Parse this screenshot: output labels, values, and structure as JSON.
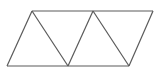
{
  "figure": {
    "name": "parallelogram-divided-into-four-triangles",
    "canvas": {
      "width": 160,
      "height": 74,
      "background": "#ffffff"
    },
    "style": {
      "stroke_color": "#5a5a5a",
      "stroke_width": 1.2,
      "fill": "none"
    },
    "vertices": {
      "bottom_left": {
        "label": "A",
        "x": 7,
        "y": 66
      },
      "top_left": {
        "label": "B",
        "x": 32,
        "y": 11
      },
      "bottom_mid": {
        "label": "C",
        "x": 68,
        "y": 66
      },
      "top_mid": {
        "label": "D",
        "x": 93,
        "y": 11
      },
      "bottom_right": {
        "label": "E",
        "x": 129,
        "y": 66
      },
      "top_right": {
        "label": "F",
        "x": 153,
        "y": 11
      }
    },
    "edges": [
      {
        "name": "top-edge",
        "from": "top_left",
        "to": "top_right",
        "points": "32,11 153,11"
      },
      {
        "name": "bottom-edge",
        "from": "bottom_left",
        "to": "bottom_right",
        "points": "7,66 129,66"
      },
      {
        "name": "left-slant-edge",
        "from": "bottom_left",
        "to": "top_left",
        "points": "7,66 32,11"
      },
      {
        "name": "right-slant-edge",
        "from": "bottom_right",
        "to": "top_right",
        "points": "129,66 153,11"
      }
    ],
    "internal_lines": [
      {
        "name": "diagonal-1",
        "from": "top_left",
        "to": "bottom_mid",
        "points": "32,11 68,66"
      },
      {
        "name": "diagonal-2",
        "from": "bottom_mid",
        "to": "top_mid",
        "points": "68,66 93,11"
      },
      {
        "name": "diagonal-3",
        "from": "top_mid",
        "to": "bottom_right",
        "points": "93,11 129,66"
      }
    ],
    "zigzag_path": "7,66 32,11 68,66 93,11 129,66 153,11",
    "triangles": [
      {
        "name": "triangle-1-up",
        "orientation": "point-up",
        "points": "7,66 32,11 68,66"
      },
      {
        "name": "triangle-2-down",
        "orientation": "point-down",
        "points": "32,11 68,66 93,11"
      },
      {
        "name": "triangle-3-up",
        "orientation": "point-up",
        "points": "68,66 93,11 129,66"
      },
      {
        "name": "triangle-4-down",
        "orientation": "point-down",
        "points": "93,11 129,66 153,11"
      }
    ],
    "triangle_count": 4
  }
}
